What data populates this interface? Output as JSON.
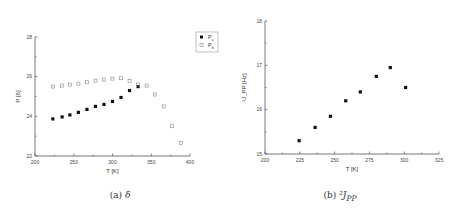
{
  "chart_data": [
    {
      "type": "scatter",
      "title": "",
      "caption": "(a) δ",
      "caption_prefix": "(a)",
      "caption_symbol": "δ",
      "xlabel": "T [K]",
      "ylabel": "P [δ]",
      "xlim": [
        200,
        400
      ],
      "ylim": [
        22,
        28
      ],
      "xticks": [
        200,
        250,
        300,
        350,
        400
      ],
      "yticks": [
        22,
        24,
        26,
        28
      ],
      "grid": false,
      "legend_position": "upper right",
      "series": [
        {
          "name": "Pa",
          "marker": "filled-square",
          "color": "#111111",
          "x": [
            223,
            235,
            245,
            256,
            267,
            278,
            289,
            300,
            311,
            322,
            333
          ],
          "y": [
            23.87,
            23.97,
            24.07,
            24.2,
            24.35,
            24.5,
            24.6,
            24.75,
            24.95,
            25.3,
            25.5
          ]
        },
        {
          "name": "Pb",
          "marker": "open-square",
          "color": "#888888",
          "x": [
            223,
            235,
            245,
            256,
            267,
            278,
            289,
            300,
            311,
            322,
            333,
            344,
            355,
            366,
            377,
            388
          ],
          "y": [
            25.5,
            25.55,
            25.6,
            25.65,
            25.72,
            25.8,
            25.85,
            25.9,
            25.92,
            25.78,
            25.6,
            25.55,
            25.1,
            24.5,
            23.5,
            22.65
          ]
        }
      ]
    },
    {
      "type": "scatter",
      "title": "",
      "caption": "(b) ²J_PP",
      "caption_prefix": "(b)",
      "caption_symbol": "²J",
      "caption_sub": "PP",
      "xlabel": "T [K]",
      "ylabel": "²J_PP [Hz]",
      "xlim": [
        200,
        325
      ],
      "ylim": [
        15,
        18
      ],
      "xticks": [
        200,
        225,
        250,
        275,
        300,
        325
      ],
      "yticks": [
        15,
        16,
        17,
        18
      ],
      "grid": false,
      "series": [
        {
          "name": "2J_PP",
          "marker": "filled-square",
          "color": "#111111",
          "x": [
            224.5,
            236,
            247,
            258,
            268.5,
            280,
            290,
            301
          ],
          "y": [
            15.3,
            15.6,
            15.85,
            16.2,
            16.4,
            16.75,
            16.95,
            16.5
          ]
        }
      ]
    }
  ]
}
